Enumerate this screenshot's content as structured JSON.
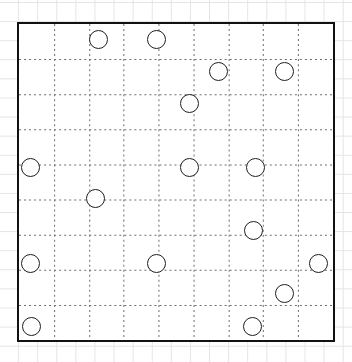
{
  "board": {
    "label": "grid-puzzle-board",
    "x": 17,
    "y": 22,
    "width": 318,
    "height": 320,
    "border_color": "#111111",
    "border_width": 2.5,
    "fill_color": "#ffffff",
    "columns": 9,
    "rows": 9,
    "grid_line_color": "#6e6e6e",
    "grid_dash": "2,3"
  },
  "background": {
    "paper_color": "#ffffff",
    "graph_line_color": "#e4e4e4",
    "graph_spacing": 19.1
  },
  "circles": {
    "count": 17,
    "radius": 9.6,
    "stroke_color": "#1f1f1f",
    "stroke_width": 1.6,
    "fill_color": "#ffffff",
    "items": [
      {
        "id": "circle-1",
        "cx": 99,
        "cy": 40,
        "col": 2,
        "row": 0
      },
      {
        "id": "circle-2",
        "cx": 157,
        "cy": 40,
        "col": 4,
        "row": 0
      },
      {
        "id": "circle-3",
        "cx": 219,
        "cy": 72,
        "col": 5,
        "row": 1
      },
      {
        "id": "circle-4",
        "cx": 285,
        "cy": 72,
        "col": 7,
        "row": 1
      },
      {
        "id": "circle-5",
        "cx": 190,
        "cy": 104,
        "col": 4,
        "row": 2
      },
      {
        "id": "circle-6",
        "cx": 31,
        "cy": 168,
        "col": 0,
        "row": 4
      },
      {
        "id": "circle-7",
        "cx": 190,
        "cy": 168,
        "col": 4,
        "row": 4
      },
      {
        "id": "circle-8",
        "cx": 256,
        "cy": 168,
        "col": 6,
        "row": 4
      },
      {
        "id": "circle-9",
        "cx": 96,
        "cy": 199,
        "col": 2,
        "row": 5
      },
      {
        "id": "circle-10",
        "cx": 254,
        "cy": 231,
        "col": 6,
        "row": 5
      },
      {
        "id": "circle-11",
        "cx": 31,
        "cy": 264,
        "col": 0,
        "row": 6
      },
      {
        "id": "circle-12",
        "cx": 157,
        "cy": 264,
        "col": 3,
        "row": 6
      },
      {
        "id": "circle-13",
        "cx": 319,
        "cy": 264,
        "col": 8,
        "row": 6
      },
      {
        "id": "circle-14",
        "cx": 285,
        "cy": 294,
        "col": 7,
        "row": 7
      },
      {
        "id": "circle-15",
        "cx": 32,
        "cy": 327,
        "col": 0,
        "row": 8
      },
      {
        "id": "circle-16",
        "cx": 253,
        "cy": 327,
        "col": 6,
        "row": 8
      }
    ]
  }
}
